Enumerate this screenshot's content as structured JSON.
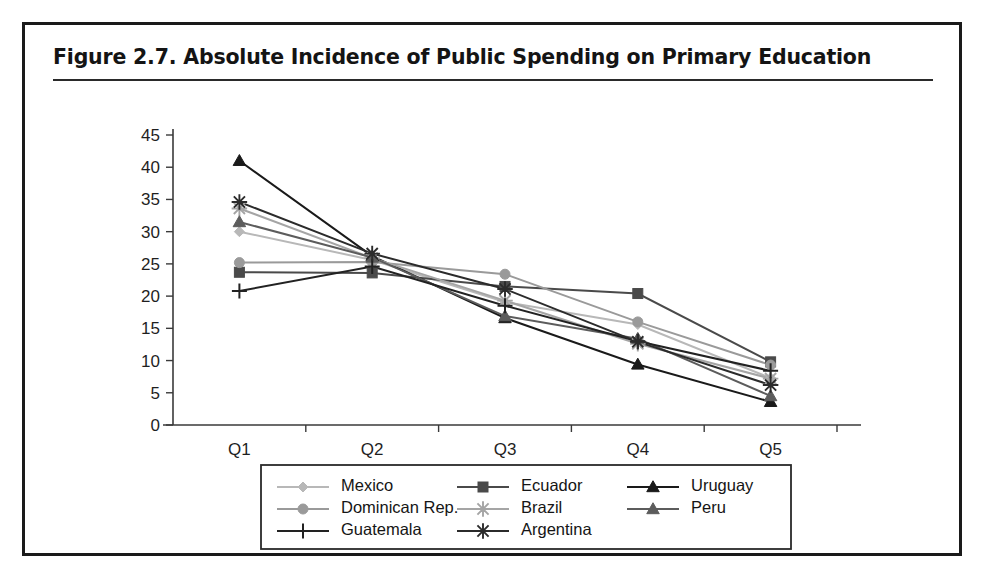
{
  "figure": {
    "title": "Figure 2.7.  Absolute Incidence of Public Spending on Primary Education"
  },
  "chart_data": {
    "type": "line",
    "title": "Figure 2.7.  Absolute Incidence of Public Spending on Primary Education",
    "xlabel": "",
    "ylabel": "",
    "categories": [
      "Q1",
      "Q2",
      "Q3",
      "Q4",
      "Q5"
    ],
    "ylim": [
      0,
      45
    ],
    "ytick_step": 5,
    "yticks": [
      0,
      5,
      10,
      15,
      20,
      25,
      30,
      35,
      40,
      45
    ],
    "grid": false,
    "legend_position": "bottom",
    "series": [
      {
        "name": "Mexico",
        "marker": "diamond",
        "color": "#b8b8b8",
        "values": [
          30.0,
          25.6,
          19.1,
          15.6,
          7.3
        ]
      },
      {
        "name": "Ecuador",
        "marker": "square",
        "color": "#4a4a4a",
        "values": [
          23.7,
          23.6,
          21.5,
          20.4,
          9.8
        ]
      },
      {
        "name": "Uruguay",
        "marker": "triangle",
        "color": "#1a1a1a",
        "values": [
          41.0,
          26.2,
          16.6,
          9.4,
          3.6
        ]
      },
      {
        "name": "Dominican Rep.",
        "marker": "circle",
        "color": "#9a9a9a",
        "values": [
          25.2,
          25.3,
          23.4,
          16.0,
          9.3
        ]
      },
      {
        "name": "Brazil",
        "marker": "asterisk",
        "color": "#a5a5a5",
        "values": [
          33.6,
          25.9,
          19.3,
          12.6,
          7.2
        ]
      },
      {
        "name": "Peru",
        "marker": "triangle",
        "color": "#5c5c5c",
        "values": [
          31.5,
          26.0,
          16.9,
          13.4,
          4.5
        ]
      },
      {
        "name": "Guatemala",
        "marker": "plus",
        "color": "#222222",
        "values": [
          20.8,
          24.6,
          18.5,
          13.0,
          8.4
        ]
      },
      {
        "name": "Argentina",
        "marker": "star",
        "color": "#2b2b2b",
        "values": [
          34.6,
          26.6,
          21.1,
          12.9,
          6.2
        ]
      }
    ]
  },
  "legend": {
    "entries": [
      {
        "label": "Mexico",
        "row": 0,
        "col": 0
      },
      {
        "label": "Ecuador",
        "row": 0,
        "col": 1
      },
      {
        "label": "Uruguay",
        "row": 0,
        "col": 2
      },
      {
        "label": "Dominican Rep.",
        "row": 1,
        "col": 0
      },
      {
        "label": "Brazil",
        "row": 1,
        "col": 1
      },
      {
        "label": "Peru",
        "row": 1,
        "col": 2
      },
      {
        "label": "Guatemala",
        "row": 2,
        "col": 0
      },
      {
        "label": "Argentina",
        "row": 2,
        "col": 1
      }
    ]
  }
}
